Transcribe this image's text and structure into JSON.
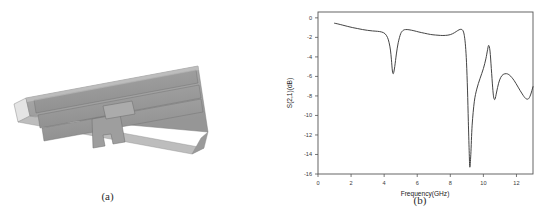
{
  "figure": {
    "panel_a": {
      "caption": "(a)",
      "description": "3D rendering of microstrip filter structure",
      "colors": {
        "substrate_top": "#a3a3a3",
        "substrate_side": "#8f8f8f",
        "substrate_front": "#b5b5b5",
        "conductor": "#9b9b9b",
        "edge": "#6e6e6e",
        "highlight": "#d8d8d8"
      }
    },
    "panel_b": {
      "caption": "(b)"
    }
  },
  "chart_data": {
    "type": "line",
    "title": "",
    "xlabel": "Frequency(GHz)",
    "ylabel": "S(2,1)(dB)",
    "xlim": [
      0,
      13
    ],
    "ylim": [
      -16,
      0.6
    ],
    "xticks": [
      0,
      2,
      4,
      6,
      8,
      10,
      12
    ],
    "xtick_labels": [
      "0",
      "2",
      "4",
      "6",
      "8",
      "10",
      "12"
    ],
    "yticks": [
      0,
      -2,
      -4,
      -6,
      -8,
      -10,
      -12,
      -14,
      -16
    ],
    "ytick_labels": [
      "0",
      "-2",
      "-4",
      "-6",
      "-8",
      "-10",
      "-12",
      "-14",
      "-16"
    ],
    "grid": false,
    "legend": null,
    "series": [
      {
        "name": "S(2,1)",
        "color": "#3a3a3a",
        "x": [
          1.0,
          1.2,
          1.5,
          1.8,
          2.1,
          2.4,
          2.7,
          3.0,
          3.3,
          3.6,
          3.85,
          4.05,
          4.2,
          4.3,
          4.38,
          4.44,
          4.5,
          4.56,
          4.64,
          4.74,
          4.85,
          5.0,
          5.15,
          5.3,
          5.5,
          5.8,
          6.1,
          6.45,
          6.8,
          7.1,
          7.4,
          7.7,
          8.0,
          8.25,
          8.45,
          8.6,
          8.72,
          8.8,
          8.86,
          8.92,
          8.98,
          9.04,
          9.09,
          9.14,
          9.18,
          9.24,
          9.32,
          9.45,
          9.6,
          9.8,
          10.0,
          10.15,
          10.25,
          10.32,
          10.4,
          10.48,
          10.56,
          10.62,
          10.7,
          10.8,
          10.92,
          11.05,
          11.2,
          11.4,
          11.6,
          11.85,
          12.1,
          12.35,
          12.55,
          12.72,
          12.85,
          13.0
        ],
        "y": [
          -0.55,
          -0.62,
          -0.75,
          -0.88,
          -1.0,
          -1.1,
          -1.2,
          -1.28,
          -1.34,
          -1.38,
          -1.45,
          -1.62,
          -2.0,
          -2.55,
          -3.3,
          -4.3,
          -5.45,
          -5.7,
          -5.0,
          -3.7,
          -2.55,
          -1.62,
          -1.28,
          -1.2,
          -1.22,
          -1.32,
          -1.45,
          -1.58,
          -1.7,
          -1.76,
          -1.8,
          -1.8,
          -1.72,
          -1.52,
          -1.3,
          -1.18,
          -1.22,
          -1.45,
          -1.95,
          -2.9,
          -4.6,
          -7.4,
          -10.6,
          -13.6,
          -15.3,
          -14.0,
          -11.0,
          -8.6,
          -7.3,
          -6.2,
          -5.2,
          -4.2,
          -3.3,
          -2.82,
          -3.4,
          -5.2,
          -7.1,
          -8.1,
          -8.35,
          -7.6,
          -6.7,
          -6.1,
          -5.8,
          -5.72,
          -5.9,
          -6.4,
          -7.1,
          -7.8,
          -8.25,
          -8.3,
          -7.9,
          -7.05
        ]
      }
    ],
    "annotations": {
      "notch_1_freq": 4.56,
      "notch_1_depth": -5.7,
      "notch_2_freq": 9.18,
      "notch_2_depth": -15.3,
      "peak_freq": 10.32,
      "peak_value": -2.82
    }
  }
}
